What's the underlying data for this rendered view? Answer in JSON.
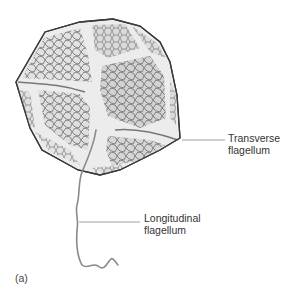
{
  "figure": {
    "panel_label": "(a)",
    "colors": {
      "background": "#ffffff",
      "plate_fill_light": "#e9e9e9",
      "plate_fill_dark": "#cfcfcf",
      "plate_net": "#555555",
      "girdle": "#f2f2f2",
      "outline": "#3a3a3a",
      "flagellum": "#8a8a8a",
      "leader_line": "#888888",
      "label_text": "#333333"
    }
  },
  "labels": {
    "transverse": {
      "line1": "Transverse",
      "line2": "flagellum"
    },
    "longitudinal": {
      "line1": "Longitudinal",
      "line2": "flagellum"
    }
  }
}
